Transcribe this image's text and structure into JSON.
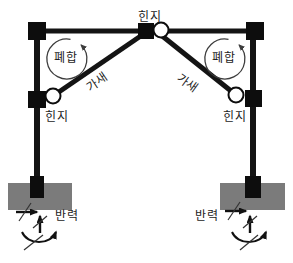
{
  "diagram": {
    "type": "structural-frame-diagram",
    "labels": {
      "hinge_top": "힌지",
      "hinge_left": "힌지",
      "hinge_right": "힌지",
      "closure_left": "폐합",
      "closure_right": "폐합",
      "brace_left": "가새",
      "brace_right": "가새",
      "reaction_left": "반력",
      "reaction_right": "반력"
    },
    "colors": {
      "member": "#141414",
      "node": "#0d0d0d",
      "hinge_fill": "#ffffff",
      "foundation": "#7b7b7b",
      "annotation": "#3d3d3d",
      "background": "#ffffff"
    }
  }
}
